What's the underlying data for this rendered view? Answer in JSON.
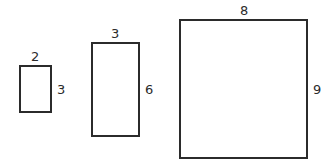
{
  "diagram": {
    "title": "",
    "stroke_color": "#2b2b2b",
    "rectangles": [
      {
        "id": "small",
        "width_label": "2",
        "height_label": "3"
      },
      {
        "id": "medium",
        "width_label": "3",
        "height_label": "6"
      },
      {
        "id": "large",
        "width_label": "8",
        "height_label": "9"
      }
    ]
  }
}
